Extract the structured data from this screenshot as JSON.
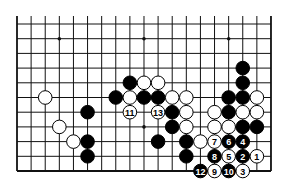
{
  "diagram": {
    "type": "go-board-fragment",
    "columns": 19,
    "rows_visible": 11,
    "edges": {
      "left": true,
      "right": true,
      "bottom": true,
      "top": false
    },
    "colors": {
      "black": "#000000",
      "white": "#ffffff",
      "line": "#111111",
      "background": "#ffffff"
    },
    "star_points": [
      {
        "col": 3,
        "row": 1
      },
      {
        "col": 9,
        "row": 1
      },
      {
        "col": 15,
        "row": 1
      },
      {
        "col": 3,
        "row": 7
      },
      {
        "col": 9,
        "row": 7
      },
      {
        "col": 15,
        "row": 7
      }
    ],
    "stones": [
      {
        "col": 16,
        "row": 3,
        "color": "black"
      },
      {
        "col": 8,
        "row": 4,
        "color": "black"
      },
      {
        "col": 9,
        "row": 4,
        "color": "white"
      },
      {
        "col": 10,
        "row": 4,
        "color": "white"
      },
      {
        "col": 16,
        "row": 4,
        "color": "black"
      },
      {
        "col": 2,
        "row": 5,
        "color": "white"
      },
      {
        "col": 7,
        "row": 5,
        "color": "black"
      },
      {
        "col": 8,
        "row": 5,
        "color": "white"
      },
      {
        "col": 9,
        "row": 5,
        "color": "black"
      },
      {
        "col": 10,
        "row": 5,
        "color": "black"
      },
      {
        "col": 11,
        "row": 5,
        "color": "white"
      },
      {
        "col": 12,
        "row": 5,
        "color": "white"
      },
      {
        "col": 15,
        "row": 5,
        "color": "black"
      },
      {
        "col": 16,
        "row": 5,
        "color": "black"
      },
      {
        "col": 17,
        "row": 5,
        "color": "white"
      },
      {
        "col": 5,
        "row": 6,
        "color": "black"
      },
      {
        "col": 8,
        "row": 6,
        "color": "white",
        "label": "11"
      },
      {
        "col": 10,
        "row": 6,
        "color": "white",
        "label": "13"
      },
      {
        "col": 11,
        "row": 6,
        "color": "black"
      },
      {
        "col": 12,
        "row": 6,
        "color": "white"
      },
      {
        "col": 14,
        "row": 6,
        "color": "white"
      },
      {
        "col": 15,
        "row": 6,
        "color": "black"
      },
      {
        "col": 16,
        "row": 6,
        "color": "white"
      },
      {
        "col": 17,
        "row": 6,
        "color": "white"
      },
      {
        "col": 3,
        "row": 7,
        "color": "white"
      },
      {
        "col": 11,
        "row": 7,
        "color": "black"
      },
      {
        "col": 12,
        "row": 7,
        "color": "white"
      },
      {
        "col": 14,
        "row": 7,
        "color": "white"
      },
      {
        "col": 15,
        "row": 7,
        "color": "white"
      },
      {
        "col": 16,
        "row": 7,
        "color": "black"
      },
      {
        "col": 17,
        "row": 7,
        "color": "black"
      },
      {
        "col": 4,
        "row": 8,
        "color": "white"
      },
      {
        "col": 5,
        "row": 8,
        "color": "black"
      },
      {
        "col": 10,
        "row": 8,
        "color": "black"
      },
      {
        "col": 12,
        "row": 8,
        "color": "black"
      },
      {
        "col": 13,
        "row": 8,
        "color": "white"
      },
      {
        "col": 14,
        "row": 8,
        "color": "white",
        "label": "7"
      },
      {
        "col": 15,
        "row": 8,
        "color": "black",
        "label": "6"
      },
      {
        "col": 16,
        "row": 8,
        "color": "black",
        "label": "4"
      },
      {
        "col": 5,
        "row": 9,
        "color": "black"
      },
      {
        "col": 12,
        "row": 9,
        "color": "black"
      },
      {
        "col": 14,
        "row": 9,
        "color": "black",
        "label": "8"
      },
      {
        "col": 15,
        "row": 9,
        "color": "white",
        "label": "5"
      },
      {
        "col": 16,
        "row": 9,
        "color": "black",
        "label": "2"
      },
      {
        "col": 17,
        "row": 9,
        "color": "white",
        "label": "1"
      },
      {
        "col": 13,
        "row": 10,
        "color": "black",
        "label": "12"
      },
      {
        "col": 14,
        "row": 10,
        "color": "white",
        "label": "9"
      },
      {
        "col": 15,
        "row": 10,
        "color": "black",
        "label": "10"
      },
      {
        "col": 16,
        "row": 10,
        "color": "white",
        "label": "3"
      }
    ]
  }
}
